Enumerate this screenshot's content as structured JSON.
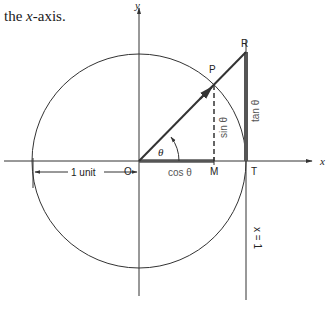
{
  "caption": {
    "prefix": "the ",
    "var": "x",
    "suffix": "-axis."
  },
  "diagram": {
    "axes": {
      "x_label": "x",
      "y_label": "y"
    },
    "points": {
      "origin": "O",
      "P": "P",
      "R": "R",
      "M": "M",
      "T": "T"
    },
    "segments": {
      "cos": "cos θ",
      "sin": "sin θ",
      "tan": "tan θ"
    },
    "angle_label": "θ",
    "line_label": "x = 1",
    "unit_label": "1 unit",
    "colors": {
      "line": "#333333",
      "thick": "#666666",
      "background": "#ffffff"
    }
  }
}
